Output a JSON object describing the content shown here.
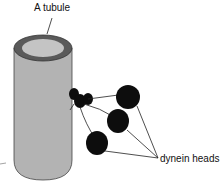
{
  "labels": {
    "tubule": "A tubule",
    "dynein": "dynein heads"
  },
  "colors": {
    "tubule_body": "#b3b3b3",
    "tubule_rim": "#5a5a5a",
    "tubule_lumen": "#c4c4c4",
    "dynein": "#0d0d0d",
    "line": "#222222"
  },
  "elements": {
    "tubule_count": 1,
    "dynein_head_count": 3
  }
}
